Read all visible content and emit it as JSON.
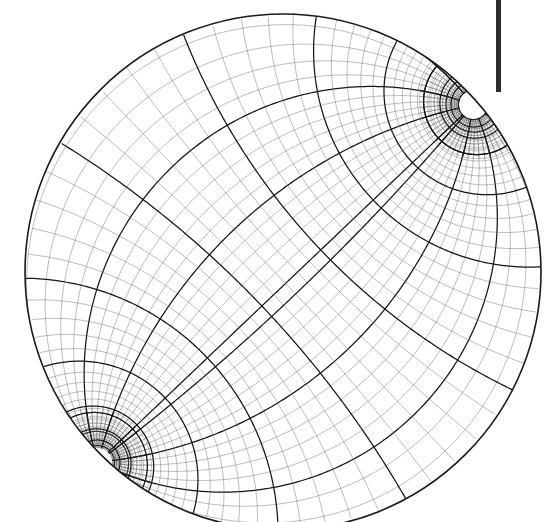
{
  "figure": {
    "type": "mathematical-diagram",
    "background_color": "#ffffff",
    "canvas": {
      "width": 555,
      "height": 522
    }
  },
  "disk": {
    "name": "unit-disk-domain",
    "center_x": 283,
    "center_y": 272,
    "radius": 258,
    "boundary_color": "#1a1a1a",
    "boundary_width": 1.6,
    "clipped_edges": [
      "bottom",
      "right"
    ]
  },
  "cusps": [
    {
      "label": "cusp-top-right",
      "x": 473,
      "y": 105,
      "core_radius": 7,
      "spoke_count": 56,
      "description": "radial spoke fan converging to singular point"
    },
    {
      "label": "cusp-bottom-left",
      "x": 98,
      "y": 462,
      "core_radius": 7,
      "spoke_count": 56,
      "description": "radial spoke fan converging to singular point"
    }
  ],
  "grid": {
    "family_a_count": 56,
    "family_b_count": 56,
    "fine_line_color": "#6a6a6a",
    "fine_line_width": 0.45,
    "bold_line_color": "#151515",
    "bold_line_width": 1.25,
    "bold_every": 5,
    "samples_per_curve": 340,
    "description": "two orthogonal families of curvilinear coordinate lines of a Mobius/conformal map with two poles"
  },
  "scale_bar": {
    "name": "scale-bar",
    "x": 496,
    "y": 0,
    "width": 5,
    "height": 92,
    "color": "#2e2e2e"
  }
}
